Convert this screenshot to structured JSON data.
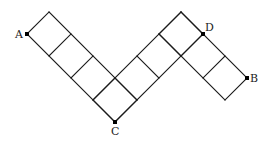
{
  "diagram": {
    "grid_unit_cells": {
      "strip_A_to_C": 4,
      "strip_C_to_D": 4,
      "strip_peak_to_B": 3
    },
    "points": [
      {
        "id": "A",
        "label": "A"
      },
      {
        "id": "B",
        "label": "B"
      },
      {
        "id": "C",
        "label": "C"
      },
      {
        "id": "D",
        "label": "D"
      }
    ],
    "colors": {
      "line": "#1a1a1a",
      "point": "#000000",
      "background": "#ffffff"
    }
  }
}
